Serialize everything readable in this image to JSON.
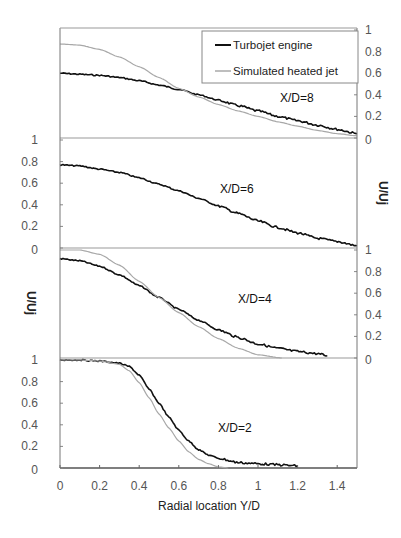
{
  "chart_data": {
    "type": "line",
    "title": "",
    "xlabel": "Radial location Y/D",
    "ylabel": "U/Uj",
    "xlim": [
      0,
      1.5
    ],
    "x_ticks": [
      "0",
      "0.2",
      "0.4",
      "0.6",
      "0.8",
      "1",
      "1.2",
      "1.4"
    ],
    "y_ticks": [
      "0",
      "0.2",
      "0.4",
      "0.6",
      "0.8",
      "1"
    ],
    "grid": false,
    "legend": {
      "position": "top-right",
      "entries": [
        {
          "name": "Turbojet engine",
          "color": "#111111"
        },
        {
          "name": "Simulated heated jet",
          "color": "#a8a8a8"
        }
      ]
    },
    "panels": [
      {
        "label": "X/D=8",
        "ylim": [
          0,
          1
        ],
        "tick_side": "right",
        "series": [
          {
            "name": "Turbojet engine",
            "x": [
              0,
              0.1,
              0.2,
              0.3,
              0.4,
              0.5,
              0.6,
              0.7,
              0.8,
              0.9,
              1.0,
              1.1,
              1.2,
              1.3,
              1.4,
              1.5
            ],
            "y": [
              0.6,
              0.59,
              0.58,
              0.56,
              0.53,
              0.49,
              0.45,
              0.4,
              0.35,
              0.3,
              0.25,
              0.2,
              0.16,
              0.12,
              0.08,
              0.04
            ]
          },
          {
            "name": "Simulated heated jet",
            "x": [
              0,
              0.1,
              0.2,
              0.3,
              0.4,
              0.5,
              0.6,
              0.7,
              0.8,
              0.9,
              1.0,
              1.1,
              1.2,
              1.3,
              1.4,
              1.5
            ],
            "y": [
              0.87,
              0.86,
              0.82,
              0.75,
              0.66,
              0.56,
              0.46,
              0.38,
              0.31,
              0.25,
              0.2,
              0.15,
              0.11,
              0.07,
              0.04,
              0.02
            ]
          }
        ]
      },
      {
        "label": "X/D=6",
        "ylim": [
          0,
          1
        ],
        "tick_side": "left",
        "series": [
          {
            "name": "Turbojet engine",
            "x": [
              0,
              0.1,
              0.2,
              0.3,
              0.4,
              0.5,
              0.6,
              0.7,
              0.8,
              0.9,
              1.0,
              1.1,
              1.2,
              1.3,
              1.4,
              1.5
            ],
            "y": [
              0.77,
              0.76,
              0.73,
              0.7,
              0.65,
              0.59,
              0.53,
              0.46,
              0.39,
              0.32,
              0.25,
              0.19,
              0.14,
              0.09,
              0.06,
              0.02
            ]
          }
        ]
      },
      {
        "label": "X/D=4",
        "ylim": [
          0,
          1
        ],
        "tick_side": "right",
        "series": [
          {
            "name": "Turbojet engine",
            "x": [
              0,
              0.1,
              0.2,
              0.3,
              0.4,
              0.5,
              0.6,
              0.7,
              0.8,
              0.9,
              1.0,
              1.1,
              1.2,
              1.3,
              1.35
            ],
            "y": [
              0.92,
              0.9,
              0.85,
              0.77,
              0.67,
              0.56,
              0.45,
              0.35,
              0.26,
              0.19,
              0.13,
              0.09,
              0.06,
              0.04,
              0.02
            ]
          },
          {
            "name": "Simulated heated jet",
            "x": [
              0,
              0.1,
              0.2,
              0.3,
              0.4,
              0.5,
              0.6,
              0.7,
              0.8,
              0.9,
              1.0,
              1.12
            ],
            "y": [
              1.0,
              1.0,
              0.96,
              0.86,
              0.71,
              0.56,
              0.42,
              0.29,
              0.18,
              0.09,
              0.03,
              0.0
            ]
          }
        ]
      },
      {
        "label": "X/D=2",
        "ylim": [
          0,
          1
        ],
        "tick_side": "left",
        "series": [
          {
            "name": "Turbojet engine",
            "x": [
              0,
              0.1,
              0.2,
              0.3,
              0.35,
              0.4,
              0.45,
              0.5,
              0.55,
              0.6,
              0.65,
              0.7,
              0.75,
              0.8,
              0.9,
              1.0,
              1.1,
              1.2
            ],
            "y": [
              1.0,
              1.0,
              0.99,
              0.97,
              0.94,
              0.86,
              0.73,
              0.6,
              0.47,
              0.35,
              0.25,
              0.17,
              0.12,
              0.09,
              0.05,
              0.04,
              0.03,
              0.02
            ]
          },
          {
            "name": "Simulated heated jet",
            "x": [
              0,
              0.1,
              0.2,
              0.3,
              0.35,
              0.4,
              0.45,
              0.5,
              0.55,
              0.6,
              0.65,
              0.7,
              0.75,
              0.8,
              0.85
            ],
            "y": [
              1.0,
              1.0,
              0.99,
              0.96,
              0.9,
              0.79,
              0.65,
              0.5,
              0.37,
              0.25,
              0.15,
              0.08,
              0.04,
              0.01,
              0.0
            ]
          }
        ]
      }
    ]
  }
}
